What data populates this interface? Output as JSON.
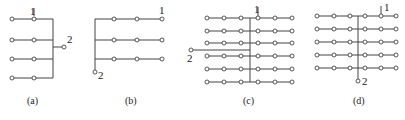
{
  "figure": {
    "panels": [
      {
        "id": "a",
        "caption": "(a)",
        "terminal_1_label": "1",
        "terminal_2_label": "2",
        "rows": 4,
        "columns": 2,
        "bus": "vertical-right",
        "terminal_2_position": "right-of-bus"
      },
      {
        "id": "b",
        "caption": "(b)",
        "terminal_1_label": "1",
        "terminal_2_label": "2",
        "rows": 3,
        "columns": 3,
        "bus": "vertical-left",
        "terminal_2_position": "bottom-of-bus"
      },
      {
        "id": "c",
        "caption": "(c)",
        "terminal_1_label": "1",
        "terminal_2_label": "2",
        "rows": 6,
        "columns_left": 3,
        "columns_right": 3,
        "bus": "vertical-center",
        "terminal_2_position": "left-feed"
      },
      {
        "id": "d",
        "caption": "(d)",
        "terminal_1_label": "1",
        "terminal_2_label": "2",
        "rows": 5,
        "columns_left": 3,
        "columns_right": 3,
        "bus": "vertical-center",
        "terminal_2_position": "bottom-of-bus"
      }
    ]
  }
}
